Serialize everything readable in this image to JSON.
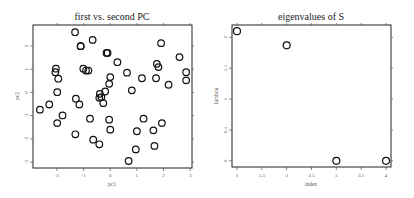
{
  "chart_data": [
    {
      "type": "scatter",
      "title": "first  vs. second PC",
      "xlabel": "pc1",
      "ylabel": "pc2",
      "xlim": [
        -2.9,
        3.07
      ],
      "ylim": [
        -3.25,
        2.9
      ],
      "xticks": [
        -2,
        -1,
        0,
        1,
        2,
        3
      ],
      "yticks": [
        -3,
        -2,
        -1,
        0,
        1,
        2
      ],
      "grid": false,
      "marker": "open-circle",
      "points": [
        [
          -1.32,
          2.59
        ],
        [
          -0.66,
          2.26
        ],
        [
          -1.11,
          1.99
        ],
        [
          -1.11,
          1.99
        ],
        [
          -0.14,
          1.7
        ],
        [
          -0.1,
          1.7
        ],
        [
          1.91,
          2.12
        ],
        [
          -2.04,
          1.02
        ],
        [
          -2.06,
          0.87
        ],
        [
          -1.95,
          0.59
        ],
        [
          -1.01,
          1.02
        ],
        [
          -0.91,
          0.94
        ],
        [
          -0.82,
          0.94
        ],
        [
          0.27,
          1.3
        ],
        [
          0.63,
          0.85
        ],
        [
          0.0,
          0.66
        ],
        [
          -0.04,
          0.37
        ],
        [
          0.81,
          0.09
        ],
        [
          1.19,
          0.61
        ],
        [
          1.75,
          1.23
        ],
        [
          1.81,
          1.09
        ],
        [
          1.72,
          0.61
        ],
        [
          2.19,
          0.33
        ],
        [
          2.6,
          1.52
        ],
        [
          2.85,
          0.87
        ],
        [
          2.85,
          0.52
        ],
        [
          -1.99,
          0.01
        ],
        [
          -2.64,
          -0.74
        ],
        [
          -2.29,
          -0.52
        ],
        [
          -1.29,
          -0.27
        ],
        [
          -1.16,
          -0.52
        ],
        [
          -0.39,
          -0.06
        ],
        [
          -0.33,
          -0.2
        ],
        [
          -0.41,
          -0.23
        ],
        [
          -0.26,
          -0.46
        ],
        [
          -0.19,
          0.04
        ],
        [
          -1.79,
          -0.99
        ],
        [
          -1.99,
          -1.32
        ],
        [
          -0.76,
          -1.13
        ],
        [
          -0.04,
          -1.17
        ],
        [
          0.0,
          -1.6
        ],
        [
          -1.31,
          -1.8
        ],
        [
          -0.64,
          -2.03
        ],
        [
          -0.41,
          -2.23
        ],
        [
          1.25,
          -1.13
        ],
        [
          1.94,
          -1.32
        ],
        [
          1.0,
          -1.67
        ],
        [
          1.62,
          -1.63
        ],
        [
          0.96,
          -2.45
        ],
        [
          1.66,
          -2.3
        ],
        [
          0.69,
          -2.95
        ]
      ]
    },
    {
      "type": "scatter",
      "title": "eigenvalues of S",
      "xlabel": "index",
      "ylabel": "lambda",
      "xlim": [
        0.9,
        4.1
      ],
      "ylim": [
        -0.1,
        2.2
      ],
      "xticks": [
        1,
        1.5,
        2,
        2.5,
        3,
        3.5,
        4
      ],
      "yticks": [
        0,
        0.5,
        1,
        1.5,
        2
      ],
      "grid": false,
      "marker": "open-circle",
      "x": [
        1,
        2,
        3,
        4
      ],
      "values": [
        2.1,
        1.87,
        0.0,
        0.0
      ]
    }
  ],
  "plot1": {
    "title": "first  vs. second PC",
    "xlabel": "pc1",
    "ylabel": "pc2",
    "xtick_labels": [
      "-2",
      "-1",
      "0",
      "1",
      "2",
      "3"
    ],
    "ytick_labels": [
      "-3",
      "-2",
      "-1",
      "0",
      "1",
      "2"
    ]
  },
  "plot2": {
    "title": "eigenvalues of S",
    "xlabel": "index",
    "ylabel": "lambda",
    "xtick_labels": [
      "1",
      "1.5",
      "2",
      "2.5",
      "3",
      "3.5",
      "4"
    ],
    "ytick_labels": [
      "0",
      "0.5",
      "1",
      "1.5",
      "2"
    ]
  }
}
